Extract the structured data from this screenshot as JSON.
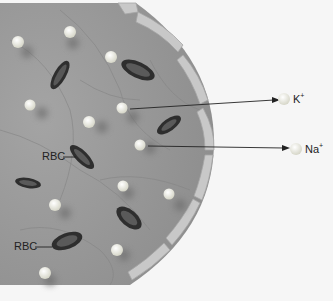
{
  "diagram": {
    "labels": {
      "rbc_1": "RBC",
      "rbc_2": "RBC",
      "ion_potassium": "K",
      "ion_potassium_charge": "+",
      "ion_sodium": "Na",
      "ion_sodium_charge": "+"
    },
    "colors": {
      "background": "#f6f6f6",
      "vessel_fill": "#9a9a9a",
      "vessel_wall": "#c4c4c4",
      "rbc": "#3a3a3a",
      "ion": "#f4f4ec",
      "arrow": "#222222"
    }
  }
}
